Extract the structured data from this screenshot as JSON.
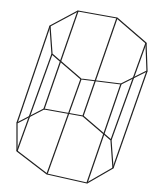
{
  "diagram": {
    "title": "",
    "shape": "octagonal prism (wireframe)",
    "stroke_color": "#222222",
    "background": "#ffffff",
    "top_face": [
      [
        78,
        11
      ],
      [
        117,
        18
      ],
      [
        146,
        43
      ],
      [
        147,
        71
      ],
      [
        121,
        84
      ],
      [
        81,
        79
      ],
      [
        52,
        54
      ],
      [
        50,
        26
      ]
    ],
    "bottom_face": [
      [
        44,
        109
      ],
      [
        83,
        116
      ],
      [
        111,
        140
      ],
      [
        113,
        168
      ],
      [
        87,
        183
      ],
      [
        47,
        174
      ],
      [
        17,
        151
      ],
      [
        17,
        123
      ]
    ]
  }
}
